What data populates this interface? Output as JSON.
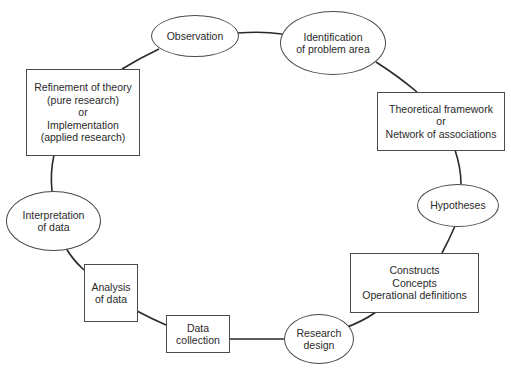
{
  "diagram": {
    "colors": {
      "stroke": "#2a2a2a",
      "text": "#2a2a2a",
      "background": "#ffffff"
    },
    "nodes": [
      {
        "id": "observation",
        "shape": "ellipse",
        "lines": [
          "Observation"
        ]
      },
      {
        "id": "identification",
        "shape": "ellipse",
        "lines": [
          "Identification",
          "of problem area"
        ]
      },
      {
        "id": "theoretical",
        "shape": "rectangle",
        "lines": [
          "Theoretical framework",
          "or",
          "Network of associations"
        ]
      },
      {
        "id": "hypotheses",
        "shape": "ellipse",
        "lines": [
          "Hypotheses"
        ]
      },
      {
        "id": "constructs",
        "shape": "rectangle",
        "lines": [
          "Constructs",
          "Concepts",
          "Operational definitions"
        ]
      },
      {
        "id": "research_design",
        "shape": "ellipse",
        "lines": [
          "Research",
          "design"
        ]
      },
      {
        "id": "data_collection",
        "shape": "rectangle",
        "lines": [
          "Data",
          "collection"
        ]
      },
      {
        "id": "analysis",
        "shape": "rectangle",
        "lines": [
          "Analysis",
          "of data"
        ]
      },
      {
        "id": "interpretation",
        "shape": "ellipse",
        "lines": [
          "Interpretation",
          "of data"
        ]
      },
      {
        "id": "refinement",
        "shape": "rectangle",
        "lines": [
          "Refinement of theory",
          "(pure research)",
          "or",
          "Implementation",
          "(applied research)"
        ]
      }
    ],
    "edges": [
      [
        "observation",
        "identification"
      ],
      [
        "identification",
        "theoretical"
      ],
      [
        "theoretical",
        "hypotheses"
      ],
      [
        "hypotheses",
        "constructs"
      ],
      [
        "constructs",
        "research_design"
      ],
      [
        "research_design",
        "data_collection"
      ],
      [
        "data_collection",
        "analysis"
      ],
      [
        "analysis",
        "interpretation"
      ],
      [
        "interpretation",
        "refinement"
      ],
      [
        "refinement",
        "observation"
      ]
    ]
  }
}
